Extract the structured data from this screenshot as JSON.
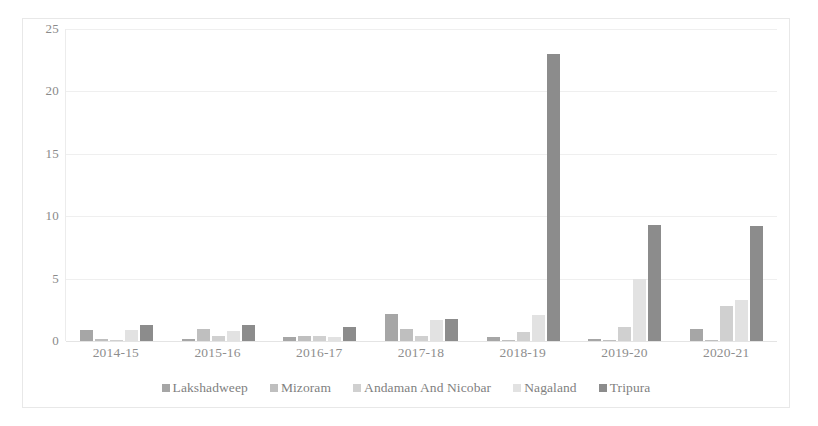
{
  "chart_data": {
    "type": "bar",
    "title": "",
    "subtitle": "",
    "xlabel": "",
    "ylabel": "",
    "categories": [
      "2014-15",
      "2015-16",
      "2016-17",
      "2017-18",
      "2018-19",
      "2019-20",
      "2020-21"
    ],
    "ylim": [
      0,
      25
    ],
    "yticks": [
      0,
      5,
      10,
      15,
      20,
      25
    ],
    "grid": true,
    "legend_position": "bottom",
    "series": [
      {
        "name": "Lakshadweep",
        "color": "#a6a6a6",
        "values": [
          0.9,
          0.2,
          0.3,
          2.2,
          0.3,
          0.2,
          1.0
        ]
      },
      {
        "name": "Mizoram",
        "color": "#bfbfbf",
        "values": [
          0.2,
          1.0,
          0.4,
          1.0,
          0.1,
          0.1,
          0.1
        ]
      },
      {
        "name": "Andaman And Nicobar",
        "color": "#d0d0d0",
        "values": [
          0.05,
          0.4,
          0.4,
          0.4,
          0.7,
          1.1,
          2.8
        ]
      },
      {
        "name": "Nagaland",
        "color": "#e2e2e2",
        "values": [
          0.9,
          0.8,
          0.3,
          1.7,
          2.1,
          5.0,
          3.3
        ]
      },
      {
        "name": "Tripura",
        "color": "#8c8c8c",
        "values": [
          1.3,
          1.3,
          1.1,
          1.8,
          23.0,
          9.3,
          9.2
        ]
      }
    ]
  },
  "axis": {
    "y_tick_labels": [
      "25",
      "20",
      "15",
      "10",
      "5",
      "0"
    ],
    "x_tick_labels": [
      "2014-15",
      "2015-16",
      "2016-17",
      "2017-18",
      "2018-19",
      "2019-20",
      "2020-21"
    ]
  },
  "legend": {
    "items": [
      {
        "label": "Lakshadweep",
        "color": "#a6a6a6"
      },
      {
        "label": "Mizoram",
        "color": "#bfbfbf"
      },
      {
        "label": "Andaman And Nicobar",
        "color": "#d0d0d0"
      },
      {
        "label": "Nagaland",
        "color": "#e2e2e2"
      },
      {
        "label": "Tripura",
        "color": "#8c8c8c"
      }
    ]
  },
  "style": {
    "background": "#ffffff",
    "border_color": "#e8e8e8",
    "gridline_color": "#efefef",
    "tick_label_color": "#8a8a8a"
  }
}
